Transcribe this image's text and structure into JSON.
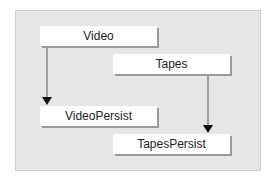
{
  "diagram": {
    "nodes": [
      {
        "id": "video",
        "label": "Video"
      },
      {
        "id": "tapes",
        "label": "Tapes"
      },
      {
        "id": "video-persist",
        "label": "VideoPersist"
      },
      {
        "id": "tapes-persist",
        "label": "TapesPersist"
      }
    ],
    "edges": [
      {
        "from": "video",
        "to": "video-persist"
      },
      {
        "from": "tapes",
        "to": "tapes-persist"
      }
    ],
    "colors": {
      "background": "#e6e6e6",
      "node_fill": "#ffffff",
      "shadow": "#9a9a9a",
      "arrow": "#555555"
    }
  }
}
